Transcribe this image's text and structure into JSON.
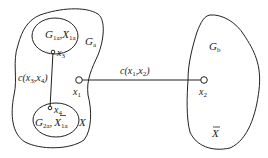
{
  "diagram": {
    "regions": {
      "Ga": {
        "main": "G",
        "sub": "a"
      },
      "Gb": {
        "main": "G",
        "sub": "b"
      },
      "X": {
        "main": "X"
      },
      "Xbar": {
        "main": "X",
        "bar": true
      }
    },
    "subregions": {
      "top": {
        "g_main": "G",
        "g_sub": "1a",
        "sep": ",",
        "x_main": "X",
        "x_sub": "1a"
      },
      "bottom": {
        "g_main": "G",
        "g_sub": "2a",
        "sep": ",",
        "x_main": "X",
        "x_sub": "1a",
        "x_bar": true
      }
    },
    "nodes": {
      "x1": {
        "main": "x",
        "sub": "1"
      },
      "x2": {
        "main": "x",
        "sub": "2"
      },
      "x3": {
        "main": "x",
        "sub": "3"
      },
      "x4": {
        "main": "x",
        "sub": "4"
      }
    },
    "edges": {
      "e12": {
        "prefix": "c(",
        "a_main": "x",
        "a_sub": "1",
        "comma": ",",
        "b_main": "x",
        "b_sub": "2",
        "suffix": ")"
      },
      "e34": {
        "prefix": "c(",
        "a_main": "x",
        "a_sub": "3",
        "comma": ",",
        "b_main": "x",
        "b_sub": "4",
        "suffix": ")"
      }
    }
  }
}
